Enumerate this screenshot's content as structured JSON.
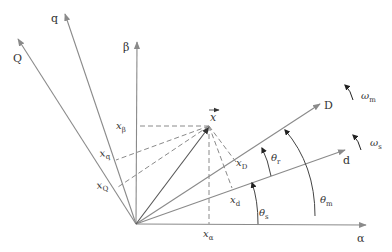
{
  "diagram": {
    "title": "",
    "colors": {
      "axis": "#8a8a8a",
      "vector": "#555555",
      "dash": "#8a8a8a",
      "text": "#333333",
      "rotation_arrow": "#222222"
    },
    "origin": [
      136,
      224
    ],
    "axes": [
      {
        "id": "alpha",
        "label": "α",
        "tip": [
          366,
          225
        ],
        "label_pos": [
          358,
          240
        ]
      },
      {
        "id": "beta",
        "label": "β",
        "tip": [
          137,
          42
        ],
        "label_pos": [
          124,
          50
        ]
      },
      {
        "id": "d",
        "label": "d",
        "tip": [
          345,
          150
        ],
        "label_pos": [
          344,
          163
        ]
      },
      {
        "id": "q",
        "label": "q",
        "tip": [
          65,
          14
        ],
        "label_pos": [
          50,
          22
        ]
      },
      {
        "id": "D",
        "label": "D",
        "tip": [
          320,
          104
        ],
        "label_pos": [
          324,
          110
        ]
      },
      {
        "id": "Q",
        "label": "Q",
        "tip": [
          18,
          39
        ],
        "label_pos": [
          14,
          61
        ]
      }
    ],
    "vector": {
      "label": "x",
      "tip": [
        210,
        126
      ],
      "label_pos": [
        212,
        118
      ]
    },
    "projections": [
      {
        "label": "x",
        "sub": "β",
        "pos": [
          117,
          129
        ]
      },
      {
        "label": "x",
        "sub": "q",
        "pos": [
          99,
          157
        ]
      },
      {
        "label": "x",
        "sub": "Q",
        "pos": [
          96,
          189
        ]
      },
      {
        "label": "x",
        "sub": "D",
        "pos": [
          232,
          167
        ]
      },
      {
        "label": "x",
        "sub": "d",
        "pos": [
          230,
          200
        ]
      },
      {
        "label": "x",
        "sub": "α",
        "pos": [
          205,
          237
        ]
      }
    ],
    "angles": [
      {
        "label": "θ",
        "sub": "s"
      },
      {
        "label": "θ",
        "sub": "r"
      },
      {
        "label": "θ",
        "sub": "m"
      }
    ],
    "rotations": [
      {
        "label": "ω",
        "sub": "m"
      },
      {
        "label": "ω",
        "sub": "s"
      }
    ]
  }
}
